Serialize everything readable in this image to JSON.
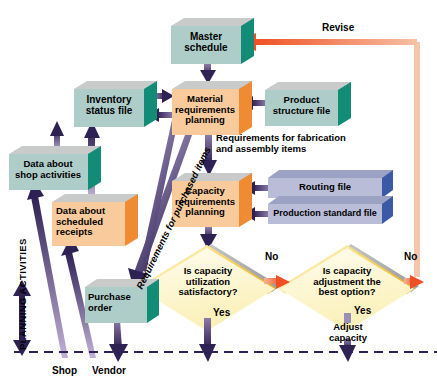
{
  "figure": {
    "type": "flowchart",
    "section_label": "PLANNING ACTIVITIES"
  },
  "boxes": [
    {
      "id": "master-schedule",
      "label": "Master\nschedule",
      "shape": "3d-box",
      "face_color": "#aecdc9",
      "side_color": "#128b77",
      "top_color": "#b9bbbb",
      "x": 171,
      "y": 22,
      "w": 75,
      "h": 42
    },
    {
      "id": "inventory-status-file",
      "label": "Inventory\nstatus file",
      "shape": "3d-box",
      "face_color": "#aecdc9",
      "side_color": "#128b77",
      "top_color": "#b9bbbb",
      "x": 74,
      "y": 85,
      "w": 75,
      "h": 42
    },
    {
      "id": "material-requirements-planning",
      "label": "Material\nrequirements\nplanning",
      "shape": "3d-box",
      "face_color": "#f9cb9c",
      "side_color": "#ee8b33",
      "top_color": "#b9bbbb",
      "x": 172,
      "y": 85,
      "w": 72,
      "h": 50
    },
    {
      "id": "product-structure-file",
      "label": "Product\nstructure file",
      "shape": "3d-box",
      "face_color": "#aecdc9",
      "side_color": "#128b77",
      "top_color": "#b9bbbb",
      "x": 265,
      "y": 86,
      "w": 78,
      "h": 40
    },
    {
      "id": "data-about-shop-activities",
      "label": "Data about\nshop activities",
      "shape": "3d-box",
      "face_color": "#aecdc9",
      "side_color": "#128b77",
      "top_color": "#b9bbbb",
      "x": 9,
      "y": 150,
      "w": 84,
      "h": 40
    },
    {
      "id": "data-about-scheduled-receipts",
      "label": "Data about\nscheduled\nreceipts",
      "shape": "3d-box",
      "face_color": "#f9cb9c",
      "side_color": "#ee8b33",
      "top_color": "#b9bbbb",
      "x": 52,
      "y": 198,
      "w": 78,
      "h": 48
    },
    {
      "id": "capacity-requirements-planning",
      "label": "Capacity\nrequirements\nplanning",
      "shape": "3d-box",
      "face_color": "#f9cb9c",
      "side_color": "#ee8b33",
      "top_color": "#b9bbbb",
      "x": 172,
      "y": 177,
      "w": 72,
      "h": 50
    },
    {
      "id": "routing-file",
      "label": "Routing file",
      "shape": "3d-slab",
      "face_color": "#b9bdd8",
      "side_color": "#3a5aa8",
      "top_color": "#9ca2c4",
      "x": 268,
      "y": 178,
      "w": 118,
      "h": 21
    },
    {
      "id": "production-standard-file",
      "label": "Production standard file",
      "shape": "3d-slab",
      "face_color": "#b9bdd8",
      "side_color": "#3a5aa8",
      "top_color": "#9ca2c4",
      "x": 268,
      "y": 204,
      "w": 118,
      "h": 21
    },
    {
      "id": "purchase-order",
      "label": "Purchase\norder",
      "shape": "3d-box",
      "face_color": "#aecdc9",
      "side_color": "#128b77",
      "top_color": "#b9bbbb",
      "x": 85,
      "y": 283,
      "w": 62,
      "h": 40
    }
  ],
  "decisions": [
    {
      "id": "is-capacity-utilization-satisfactory",
      "label": "Is capacity\nutilization\nsatisfactory?",
      "shape": "diamond",
      "fill_color": "#fdf6c8",
      "edge_color": "#f5c230",
      "cx": 207,
      "cy": 287,
      "rx": 72,
      "ry": 46,
      "yes_label": "Yes",
      "no_label": "No"
    },
    {
      "id": "is-capacity-adjustment-best-option",
      "label": "Is capacity\nadjustment the\nbest option?",
      "shape": "diamond",
      "fill_color": "#fdf6c8",
      "edge_color": "#f5c230",
      "cx": 347,
      "cy": 287,
      "rx": 70,
      "ry": 46,
      "yes_label": "Yes",
      "no_label": "No"
    }
  ],
  "annotations": [
    {
      "id": "revise",
      "text": "Revise",
      "x": 324,
      "y": 24
    },
    {
      "id": "requirements-fabrication",
      "text": "Requirements for fabrication\nand assembly items",
      "x": 216,
      "y": 136
    },
    {
      "id": "requirements-purchased",
      "text": "Requirements for purchased items",
      "x": 130,
      "y": 278,
      "rotation": -63
    },
    {
      "id": "adjust-capacity",
      "text": "Adjust\ncapacity",
      "x": 324,
      "y": 325
    },
    {
      "id": "shop",
      "text": "Shop",
      "x": 57,
      "y": 368
    },
    {
      "id": "vendor",
      "text": "Vendor",
      "x": 95,
      "y": 368
    },
    {
      "id": "yes-left",
      "text": "Yes",
      "x": 212,
      "y": 310
    },
    {
      "id": "no-left",
      "text": "No",
      "x": 267,
      "y": 254
    },
    {
      "id": "yes-right",
      "text": "Yes",
      "x": 353,
      "y": 307
    },
    {
      "id": "no-right",
      "text": "No",
      "x": 406,
      "y": 254
    },
    {
      "id": "planning-activities",
      "text": "PLANNING ACTIVITIES",
      "x": 22,
      "y": 353,
      "rotation": -90
    }
  ],
  "colors": {
    "arrow_purple_dark": "#3b2a63",
    "arrow_purple_light": "#b9a8cf",
    "arrow_orange": "#ef5a28",
    "revise_line": "#f3b48e",
    "diamond_fill": "#fdf6c8",
    "diamond_edge": "#f5c230",
    "dashed_line": "#2c2158",
    "teal_face": "#aecdc9",
    "teal_side": "#128b77",
    "peach_face": "#f9cb9c",
    "peach_side": "#ee8b33",
    "blue_face": "#b9bdd8",
    "blue_side": "#3a5aa8",
    "shadow_gray": "#b9bbbb"
  },
  "flows": [
    {
      "from": "master-schedule",
      "to": "material-requirements-planning",
      "type": "arrow-purple"
    },
    {
      "from": "inventory-status-file",
      "to": "material-requirements-planning",
      "type": "arrow-purple-bidirectional"
    },
    {
      "from": "product-structure-file",
      "to": "material-requirements-planning",
      "type": "arrow-purple"
    },
    {
      "from": "material-requirements-planning",
      "to": "capacity-requirements-planning",
      "type": "arrow-purple",
      "label": "Requirements for fabrication and assembly items"
    },
    {
      "from": "material-requirements-planning",
      "to": "purchase-order",
      "type": "arrow-purple",
      "label": "Requirements for purchased items"
    },
    {
      "from": "routing-file",
      "to": "capacity-requirements-planning",
      "type": "arrow-purple"
    },
    {
      "from": "production-standard-file",
      "to": "capacity-requirements-planning",
      "type": "arrow-purple"
    },
    {
      "from": "capacity-requirements-planning",
      "to": "is-capacity-utilization-satisfactory",
      "type": "arrow-purple"
    },
    {
      "from": "is-capacity-utilization-satisfactory",
      "to": "is-capacity-adjustment-best-option",
      "type": "arrow-orange",
      "label": "No"
    },
    {
      "from": "is-capacity-adjustment-best-option",
      "to": "master-schedule",
      "type": "arrow-orange-loop",
      "label": "No / Revise"
    },
    {
      "from": "is-capacity-utilization-satisfactory",
      "to": "execution",
      "type": "arrow-purple",
      "label": "Yes"
    },
    {
      "from": "is-capacity-adjustment-best-option",
      "to": "execution",
      "type": "arrow-purple",
      "label": "Yes / Adjust capacity"
    },
    {
      "from": "shop",
      "to": "data-about-shop-activities",
      "type": "arrow-purple"
    },
    {
      "from": "vendor",
      "to": "data-about-scheduled-receipts",
      "type": "arrow-purple"
    },
    {
      "from": "data-about-shop-activities",
      "to": "inventory-status-file",
      "type": "arrow-purple"
    },
    {
      "from": "data-about-scheduled-receipts",
      "to": "inventory-status-file",
      "type": "arrow-purple"
    },
    {
      "from": "purchase-order",
      "to": "vendor",
      "type": "arrow-purple"
    }
  ]
}
